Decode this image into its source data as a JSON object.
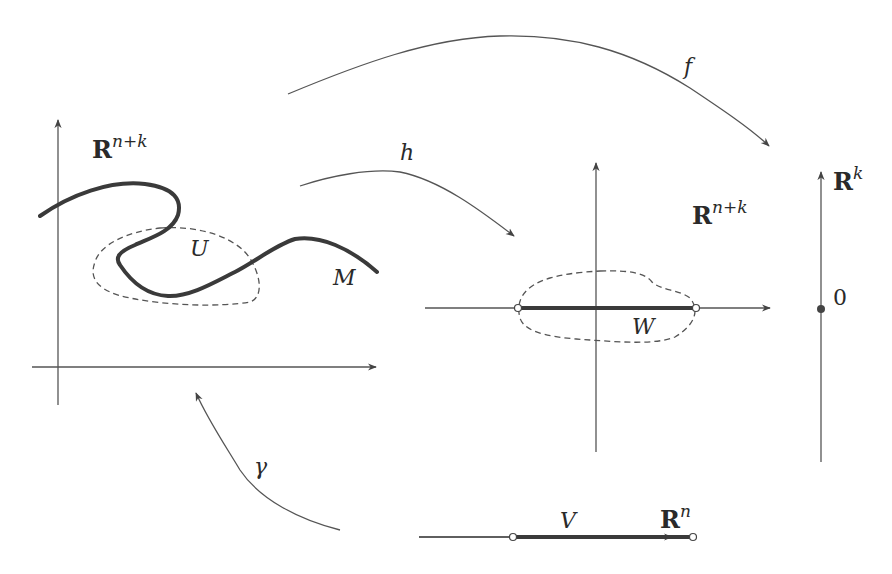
{
  "colors": {
    "stroke": "#444444",
    "thick": "#3a3a3a",
    "text": "#2a2a2a",
    "background": "#ffffff"
  },
  "left_panel": {
    "space_label": "R",
    "space_superscript": "n+k",
    "manifold_label": "M",
    "neighborhood_label": "U"
  },
  "middle_panel": {
    "space_label": "R",
    "space_superscript": "n+k",
    "region_label": "W"
  },
  "right_panel": {
    "space_label": "R",
    "space_superscript": "k",
    "origin_label": "0"
  },
  "bottom_panel": {
    "space_label": "R",
    "space_superscript": "n",
    "segment_label": "V"
  },
  "maps": {
    "f": "f",
    "h": "h",
    "gamma": "γ"
  }
}
